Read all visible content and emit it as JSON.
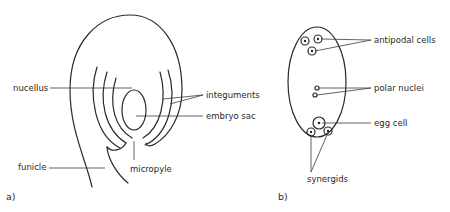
{
  "panel_a": {
    "tag": "a)",
    "labels": {
      "nucellus": "nucellus",
      "integuments": "integuments",
      "embryo_sac": "embryo sac",
      "funicle": "funicle",
      "micropyle": "micropyle"
    }
  },
  "panel_b": {
    "tag": "b)",
    "labels": {
      "antipodal_cells": "antipodal cells",
      "polar_nuclei": "polar nuclei",
      "egg_cell": "egg cell",
      "synergids": "synergids"
    }
  }
}
